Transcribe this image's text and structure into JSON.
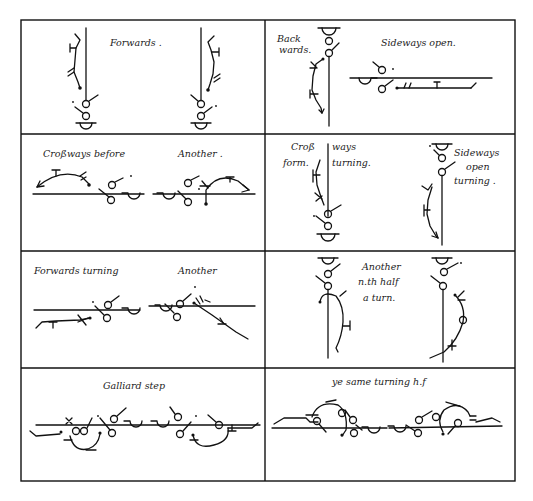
{
  "plate": {
    "title": "",
    "layout": {
      "rows": 4,
      "columns": 2
    },
    "colors": {
      "ink": "#111111",
      "paper": "#ffffff"
    }
  },
  "cells": [
    {
      "id": "r1c1",
      "captions": [
        "Forwards ."
      ]
    },
    {
      "id": "r1c2",
      "captions": [
        "Back",
        "wards.",
        "Sideways open."
      ]
    },
    {
      "id": "r2c1",
      "captions": [
        "Croßways before",
        "Another ."
      ]
    },
    {
      "id": "r2c2",
      "captions": [
        "Croß",
        "ways",
        "form.",
        "turning.",
        "Sideways",
        "open",
        "turning ."
      ]
    },
    {
      "id": "r3c1",
      "captions": [
        "Forwards turning",
        "Another"
      ]
    },
    {
      "id": "r3c2",
      "captions": [
        "Another",
        "n.th half",
        "a turn."
      ]
    },
    {
      "id": "r4c1",
      "captions": [
        "Galliard step"
      ]
    },
    {
      "id": "r4c2",
      "captions": [
        "ye same turning h.f"
      ]
    }
  ]
}
